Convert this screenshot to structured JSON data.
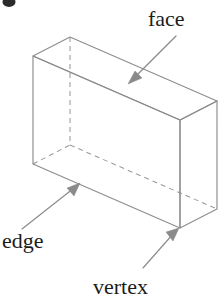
{
  "figure": {
    "background_color": "#ffffff",
    "edge_color": "#8d8d8d",
    "hidden_edge_color": "#9a9a9a",
    "leader_color": "#8a8a8a",
    "label_color": "#1c1c1c"
  },
  "labels": {
    "face": "face",
    "edge": "edge",
    "vertex": "vertex"
  },
  "annotations": [
    {
      "name": "face",
      "text": "face",
      "text_x": 148,
      "text_y": 26,
      "anchor": "start",
      "leader_from_x": 176,
      "leader_from_y": 36,
      "leader_to_x": 130,
      "leader_to_y": 82,
      "arrow_angle_deg": 135
    },
    {
      "name": "edge",
      "text": "edge",
      "text_x": 2,
      "text_y": 248,
      "anchor": "start",
      "leader_from_x": 22,
      "leader_from_y": 229,
      "leader_to_x": 79,
      "leader_to_y": 184,
      "arrow_angle_deg": 322
    },
    {
      "name": "vertex",
      "text": "vertex",
      "text_x": 93,
      "text_y": 294,
      "anchor": "start",
      "leader_from_x": 143,
      "leader_from_y": 268,
      "leader_to_x": 178,
      "leader_to_y": 230,
      "arrow_angle_deg": 313
    }
  ],
  "prism": {
    "projection": "oblique",
    "depth_offset_x": 37,
    "depth_offset_y": -19,
    "front_face": {
      "top_left": [
        33,
        56
      ],
      "top_right": [
        180,
        120
      ],
      "bottom_right": [
        180,
        228
      ],
      "bottom_left": [
        33,
        164
      ]
    },
    "back_face": {
      "top_left": [
        70,
        37
      ],
      "top_right": [
        217,
        101
      ],
      "bottom_right": [
        217,
        209
      ],
      "bottom_left": [
        70,
        145
      ]
    },
    "visible_edges": [
      "front-top",
      "front-right",
      "front-bottom",
      "front-left",
      "top-back-left",
      "top-back-right",
      "back-top-right-vertical",
      "back-right-vertical",
      "back-top-edge"
    ],
    "hidden_edges": [
      "back-left-vertical",
      "back-bottom-left",
      "back-bottom-right"
    ]
  },
  "corner_mark": {
    "name": "page-corner-mark",
    "x": 4,
    "y": 2,
    "width": 11,
    "height": 8,
    "color": "#2b2b2b"
  }
}
